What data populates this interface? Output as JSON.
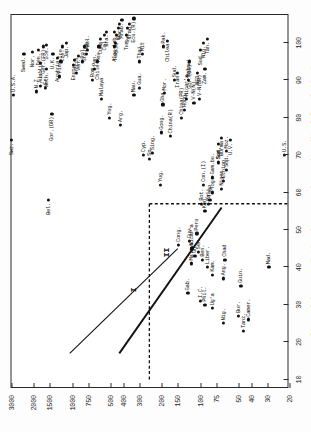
{
  "figure": {
    "orientation": "rotated-90-ccw"
  },
  "chart_data": {
    "type": "scatter",
    "title": "",
    "xlabel": "Size of Largest Native-Language Community (% of Population)",
    "ylabel": "Gross\nDomestic\nProduct\nper\nCapita\n(U.S. $)",
    "xlim": [
      8,
      108
    ],
    "ylim_log_labels": [
      "20",
      "30",
      "40",
      "50",
      "75",
      "100",
      "150",
      "200",
      "300",
      "400",
      "500",
      "750",
      "1000",
      "1500",
      "2000",
      "3000"
    ],
    "xticks": [
      10,
      20,
      30,
      40,
      50,
      60,
      70,
      80,
      90,
      100
    ],
    "xticklabels": [
      "10",
      "20",
      "30",
      "40",
      "50",
      "60",
      "70",
      "80",
      "90",
      "100"
    ],
    "yticks": [
      20,
      30,
      40,
      50,
      75,
      100,
      150,
      200,
      300,
      400,
      500,
      750,
      1000,
      1500,
      2000,
      3000
    ],
    "yticklabels": [
      "20",
      "30",
      "40",
      "50",
      "75",
      "100",
      "150",
      "200",
      "300",
      "400",
      "500",
      "750",
      "1000",
      "1500",
      "2000",
      "3000"
    ],
    "grid": false,
    "legend": [],
    "annotations": [
      {
        "name": "regression-line-label-I",
        "text": "I",
        "x": 34,
        "y": 330
      },
      {
        "name": "regression-line-label-II",
        "text": "II",
        "x": 44,
        "y": 185
      }
    ],
    "lines": [
      {
        "name": "regression-line-I",
        "style": "solid-thin",
        "x1": 17,
        "y1": 1050,
        "x2": 45,
        "y2": 150
      },
      {
        "name": "regression-line-II",
        "style": "solid-thick",
        "x1": 17,
        "y1": 430,
        "x2": 56,
        "y2": 68
      },
      {
        "name": "threshold-dashed",
        "style": "dashed",
        "x1": 10,
        "y1": 250,
        "x2": 57,
        "y2": 250
      },
      {
        "name": "threshold-dashed-vertical",
        "style": "dashed",
        "x1": 57,
        "y1": 250,
        "x2": 57,
        "y2": 20
      }
    ],
    "points": [
      {
        "label": "Swz.",
        "x": 74.0,
        "y": 3000,
        "pos": "left"
      },
      {
        "label": "U.S.A.",
        "x": 86.0,
        "y": 2900,
        "pos": "right"
      },
      {
        "label": "Swed.",
        "x": 97.0,
        "y": 2400,
        "pos": "left"
      },
      {
        "label": "Nor.",
        "x": 97.5,
        "y": 2060,
        "pos": "left"
      },
      {
        "label": "N.Z.",
        "x": 87.0,
        "y": 1920,
        "pos": "right"
      },
      {
        "label": "Aus'lia",
        "x": 88.5,
        "y": 1780,
        "pos": "right"
      },
      {
        "label": "Lux.",
        "x": 94.5,
        "y": 1790,
        "pos": "left"
      },
      {
        "label": "Den.",
        "x": 98.0,
        "y": 1860,
        "pos": "left"
      },
      {
        "label": "Ger.(FR)",
        "x": 99.0,
        "y": 1700,
        "pos": "left"
      },
      {
        "label": "Fr.",
        "x": 88.0,
        "y": 1620,
        "pos": "right"
      },
      {
        "label": "Neth.",
        "x": 93.0,
        "y": 1610,
        "pos": "left"
      },
      {
        "label": "Ice.",
        "x": 99.5,
        "y": 1600,
        "pos": "left"
      },
      {
        "label": "Bel.",
        "x": 58.0,
        "y": 1540,
        "pos": "left"
      },
      {
        "label": "Gor.(DR)",
        "x": 81.0,
        "y": 1450,
        "pos": "left"
      },
      {
        "label": "Austria",
        "x": 96.0,
        "y": 1310,
        "pos": "left"
      },
      {
        "label": "U.K.",
        "x": 97.0,
        "y": 1420,
        "pos": "left"
      },
      {
        "label": "Fin.",
        "x": 91.0,
        "y": 1260,
        "pos": "right"
      },
      {
        "label": "Ire.",
        "x": 95.0,
        "y": 1230,
        "pos": "right"
      },
      {
        "label": "Cze.",
        "x": 99.0,
        "y": 1190,
        "pos": "left"
      },
      {
        "label": "Jap.",
        "x": 100.0,
        "y": 1110,
        "pos": "left"
      },
      {
        "label": "Eng.",
        "x": 94.0,
        "y": 990,
        "pos": "left"
      },
      {
        "label": "It.",
        "x": 95.5,
        "y": 960,
        "pos": "left"
      },
      {
        "label": "Trin.",
        "x": 92.0,
        "y": 930,
        "pos": "right"
      },
      {
        "label": "Ven.",
        "x": 96.5,
        "y": 900,
        "pos": "left"
      },
      {
        "label": "Pol.",
        "x": 95.0,
        "y": 830,
        "pos": "right"
      },
      {
        "label": "Gre.",
        "x": 99.0,
        "y": 810,
        "pos": "left"
      },
      {
        "label": "Hun.",
        "x": 97.0,
        "y": 780,
        "pos": "right"
      },
      {
        "label": "Bul.",
        "x": 98.0,
        "y": 760,
        "pos": "right"
      },
      {
        "label": "Rom.",
        "x": 90.0,
        "y": 700,
        "pos": "right"
      },
      {
        "label": "Pan.",
        "x": 93.0,
        "y": 670,
        "pos": "right"
      },
      {
        "label": "Chile",
        "x": 95.0,
        "y": 640,
        "pos": "left"
      },
      {
        "label": "Mex.",
        "x": 99.0,
        "y": 620,
        "pos": "left"
      },
      {
        "label": "Malaya",
        "x": 85.0,
        "y": 590,
        "pos": "right"
      },
      {
        "label": "Cuba",
        "x": 101.0,
        "y": 600,
        "pos": "left"
      },
      {
        "label": "Col.",
        "x": 102.0,
        "y": 560,
        "pos": "left"
      },
      {
        "label": "Bra.",
        "x": 103.0,
        "y": 540,
        "pos": "left"
      },
      {
        "label": "Yug.",
        "x": 80.0,
        "y": 510,
        "pos": "right"
      },
      {
        "label": "Alg.",
        "x": 99.0,
        "y": 470,
        "pos": "left"
      },
      {
        "label": "Turk.",
        "x": 100.0,
        "y": 460,
        "pos": "left"
      },
      {
        "label": "S.Af.",
        "x": 102.0,
        "y": 455,
        "pos": "left"
      },
      {
        "label": "Leb.",
        "x": 103.0,
        "y": 470,
        "pos": "left"
      },
      {
        "label": "Ec.",
        "x": 104.0,
        "y": 440,
        "pos": "left"
      },
      {
        "label": "Por.",
        "x": 105.0,
        "y": 430,
        "pos": "left"
      },
      {
        "label": "Arab.",
        "x": 106.0,
        "y": 410,
        "pos": "left"
      },
      {
        "label": "Tun.",
        "x": 102.0,
        "y": 380,
        "pos": "left"
      },
      {
        "label": "Syr.",
        "x": 104.0,
        "y": 370,
        "pos": "left"
      },
      {
        "label": "Iraq",
        "x": 105.0,
        "y": 360,
        "pos": "left"
      },
      {
        "label": "Ecu.(R)",
        "x": 106.5,
        "y": 330,
        "pos": "left"
      },
      {
        "label": "Thai.",
        "x": 95.0,
        "y": 300,
        "pos": "right"
      },
      {
        "label": "Mit",
        "x": 97.0,
        "y": 285,
        "pos": "right"
      },
      {
        "label": "Arg.",
        "x": 78.0,
        "y": 420,
        "pos": "right"
      },
      {
        "label": "Cyp.",
        "x": 70.0,
        "y": 280,
        "pos": "right"
      },
      {
        "label": "Mau.",
        "x": 86.0,
        "y": 330,
        "pos": "right"
      },
      {
        "label": "Gua.",
        "x": 88.0,
        "y": 300,
        "pos": "right"
      },
      {
        "label": "Sp.",
        "x": 69.0,
        "y": 250,
        "pos": "right"
      },
      {
        "label": "Sing.",
        "x": 70.5,
        "y": 235,
        "pos": "right"
      },
      {
        "label": "Yug.",
        "x": 62.0,
        "y": 205,
        "pos": "right"
      },
      {
        "label": "Gha.",
        "x": 83.5,
        "y": 196,
        "pos": "right"
      },
      {
        "label": "Mor.",
        "x": 86.5,
        "y": 190,
        "pos": "right"
      },
      {
        "label": "Pak.",
        "x": 99.0,
        "y": 195,
        "pos": "right"
      },
      {
        "label": "Chilea",
        "x": 100.5,
        "y": 180,
        "pos": "left"
      },
      {
        "label": "Gong.",
        "x": 76.0,
        "y": 200,
        "pos": "right"
      },
      {
        "label": "China(R)",
        "x": 75.0,
        "y": 170,
        "pos": "right"
      },
      {
        "label": "Sud.",
        "x": 90.0,
        "y": 160,
        "pos": "right"
      },
      {
        "label": "Iran",
        "x": 92.0,
        "y": 150,
        "pos": "left"
      },
      {
        "label": "Cong.",
        "x": 46.0,
        "y": 148,
        "pos": "right"
      },
      {
        "label": "China(PR)",
        "x": 80.0,
        "y": 140,
        "pos": "right"
      },
      {
        "label": "Hong.",
        "x": 82.0,
        "y": 132,
        "pos": "right"
      },
      {
        "label": "Nicar'a",
        "x": 85.0,
        "y": 128,
        "pos": "right"
      },
      {
        "label": "Malawi",
        "x": 90.0,
        "y": 124,
        "pos": "right"
      },
      {
        "label": "Gor.(DR)",
        "x": 95.0,
        "y": 122,
        "pos": "left"
      },
      {
        "label": "V-N(N)",
        "x": 84.0,
        "y": 112,
        "pos": "right"
      },
      {
        "label": "V-N(DR)",
        "x": 85.0,
        "y": 102,
        "pos": "right"
      },
      {
        "label": "NED",
        "x": 92.0,
        "y": 105,
        "pos": "left"
      },
      {
        "label": "Sud.",
        "x": 98.0,
        "y": 100,
        "pos": "left"
      },
      {
        "label": "Zam.",
        "x": 93.0,
        "y": 92,
        "pos": "left"
      },
      {
        "label": "Nig.",
        "x": 100.0,
        "y": 95,
        "pos": "left"
      },
      {
        "label": "Tan.",
        "x": 101.0,
        "y": 88,
        "pos": "left"
      },
      {
        "label": "Guy.",
        "x": 47.0,
        "y": 122,
        "pos": "right"
      },
      {
        "label": "Gab.",
        "x": 33.0,
        "y": 125,
        "pos": "right"
      },
      {
        "label": "Malaya",
        "x": 41.0,
        "y": 118,
        "pos": "right"
      },
      {
        "label": "Nicar'a",
        "x": 45.0,
        "y": 116,
        "pos": "right"
      },
      {
        "label": "Gh.",
        "x": 43.0,
        "y": 110,
        "pos": "right"
      },
      {
        "label": "Sen.",
        "x": 44.0,
        "y": 104,
        "pos": "right"
      },
      {
        "label": "Peru",
        "x": 49.0,
        "y": 106,
        "pos": "right"
      },
      {
        "label": "I.C.",
        "x": 31.0,
        "y": 100,
        "pos": "right"
      },
      {
        "label": "Ben.",
        "x": 42.0,
        "y": 96,
        "pos": "right"
      },
      {
        "label": "Phil.",
        "x": 30.0,
        "y": 92,
        "pos": "right"
      },
      {
        "label": "Liber.",
        "x": 40.0,
        "y": 88,
        "pos": "right"
      },
      {
        "label": "Bot.",
        "x": 57.0,
        "y": 98,
        "pos": "right"
      },
      {
        "label": "Ken.",
        "x": 55.0,
        "y": 92,
        "pos": "right"
      },
      {
        "label": "Mali",
        "x": 57.0,
        "y": 86,
        "pos": "right"
      },
      {
        "label": "Togo",
        "x": 58.0,
        "y": 84,
        "pos": "right"
      },
      {
        "label": "Ug'a",
        "x": 29.0,
        "y": 80,
        "pos": "right"
      },
      {
        "label": "Kam.",
        "x": 38.0,
        "y": 80,
        "pos": "right"
      },
      {
        "label": "Con.(I)",
        "x": 62.0,
        "y": 94,
        "pos": "right"
      },
      {
        "label": "Nig.",
        "x": 25.0,
        "y": 66,
        "pos": "right"
      },
      {
        "label": "Ang.",
        "x": 37.0,
        "y": 66,
        "pos": "right"
      },
      {
        "label": "Chad",
        "x": 42.0,
        "y": 64,
        "pos": "right"
      },
      {
        "label": "Tog.",
        "x": 60.0,
        "y": 80,
        "pos": "right"
      },
      {
        "label": "Gam.bu.",
        "x": 64.0,
        "y": 80,
        "pos": "right"
      },
      {
        "label": "Niger",
        "x": 61.0,
        "y": 68,
        "pos": "right"
      },
      {
        "label": "Ethiop.",
        "x": 63.0,
        "y": 66,
        "pos": "right"
      },
      {
        "label": "Sud.",
        "x": 68.0,
        "y": 72,
        "pos": "right"
      },
      {
        "label": "Sup.",
        "x": 66.0,
        "y": 62,
        "pos": "right"
      },
      {
        "label": "Moz.",
        "x": 71.0,
        "y": 62,
        "pos": "right"
      },
      {
        "label": "Som.",
        "x": 73.0,
        "y": 72,
        "pos": "left"
      },
      {
        "label": "Burma",
        "x": 74.5,
        "y": 68,
        "pos": "left"
      },
      {
        "label": "U.V.",
        "x": 74.0,
        "y": 58,
        "pos": "left"
      },
      {
        "label": "Bur.",
        "x": 27.0,
        "y": 50,
        "pos": "right"
      },
      {
        "label": "Guin.",
        "x": 35.0,
        "y": 48,
        "pos": "right"
      },
      {
        "label": "Tanz.",
        "x": 23.0,
        "y": 46,
        "pos": "right"
      },
      {
        "label": "Camer.",
        "x": 26.0,
        "y": 42,
        "pos": "right"
      },
      {
        "label": "Mad.",
        "x": 40.0,
        "y": 29,
        "pos": "right"
      },
      {
        "label": "U.S.",
        "x": 70.0,
        "y": 22,
        "pos": "right"
      }
    ]
  },
  "axis_titles": {
    "x": "Size of Largest Native-Language Community (% of Population)",
    "y_lines": [
      "Gross",
      "Domestic",
      "Product",
      "per",
      "Capita",
      "(U.S. $)"
    ]
  },
  "line_labels": {
    "one": "I",
    "two": "II"
  }
}
